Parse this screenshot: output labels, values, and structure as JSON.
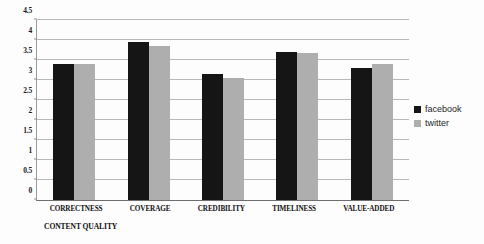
{
  "chart_data": {
    "type": "bar",
    "title": "",
    "subtitle": "",
    "xlabel": "CONTENT QUALITY",
    "ylabel": "",
    "categories": [
      "CORRECTNESS",
      "COVERAGE",
      "CREDIBILITY",
      "TIMELINESS",
      "VALUE-ADDED"
    ],
    "series": [
      {
        "name": "facebook",
        "color": "#151515",
        "values": [
          3.4,
          3.95,
          3.15,
          3.7,
          3.3
        ]
      },
      {
        "name": "twitter",
        "color": "#aeaeae",
        "values": [
          3.4,
          3.85,
          3.05,
          3.68,
          3.4
        ]
      }
    ],
    "ylim": [
      0,
      4.5
    ],
    "ytick_values": [
      0,
      0.5,
      1,
      1.5,
      2,
      2.5,
      3,
      3.5,
      4,
      4.5
    ],
    "ytick_labels": [
      "0",
      "0.5",
      "1",
      "1.5",
      "2",
      "2.5",
      "3",
      "3.5",
      "4",
      "4.5"
    ],
    "grid": true,
    "grid_axis": "y",
    "legend_position": "right"
  },
  "legend": {
    "entries": [
      {
        "label": "facebook",
        "swatch": "black-square-icon"
      },
      {
        "label": "twitter",
        "swatch": "gray-square-icon"
      }
    ]
  },
  "colors": {
    "facebook": "#151515",
    "twitter": "#aeaeae",
    "gridline": "#b9b9b9",
    "axis": "#6e6e6e",
    "background": "#fdfdfd",
    "text": "#121212"
  }
}
